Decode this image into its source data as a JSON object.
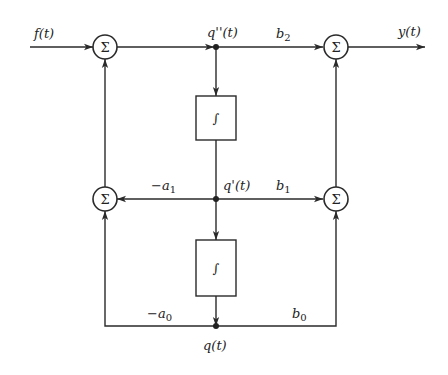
{
  "diagram": {
    "type": "block-diagram",
    "signals": {
      "input": "f(t)",
      "output": "y(t)",
      "q_dd": "q''(t)",
      "q_d": "q'(t)",
      "q": "q(t)"
    },
    "gains": {
      "b2": "b",
      "b2_sub": "2",
      "b1": "b",
      "b1_sub": "1",
      "b0": "b",
      "b0_sub": "0",
      "a1": "−a",
      "a1_sub": "1",
      "a0": "−a",
      "a0_sub": "0"
    },
    "summers": {
      "symbol": "Σ"
    },
    "integrators": {
      "symbol": "∫"
    },
    "nodes": [
      {
        "id": "sum-input",
        "label": "Σ"
      },
      {
        "id": "sum-output",
        "label": "Σ"
      },
      {
        "id": "sum-feedback",
        "label": "Σ"
      },
      {
        "id": "sum-feedforward",
        "label": "Σ"
      },
      {
        "id": "integrator-1",
        "label": "∫"
      },
      {
        "id": "integrator-2",
        "label": "∫"
      }
    ],
    "edges": [
      {
        "from": "f(t)",
        "to": "sum-input"
      },
      {
        "from": "sum-input",
        "to": "q''(t)"
      },
      {
        "from": "q''(t)",
        "to": "integrator-1"
      },
      {
        "from": "q''(t)",
        "to": "sum-output",
        "gain": "b2"
      },
      {
        "from": "sum-output",
        "to": "y(t)"
      },
      {
        "from": "integrator-1",
        "to": "q'(t)"
      },
      {
        "from": "q'(t)",
        "to": "sum-feedback",
        "gain": "-a1"
      },
      {
        "from": "q'(t)",
        "to": "sum-feedforward",
        "gain": "b1"
      },
      {
        "from": "q'(t)",
        "to": "integrator-2"
      },
      {
        "from": "integrator-2",
        "to": "q(t)"
      },
      {
        "from": "q(t)",
        "to": "sum-feedback",
        "gain": "-a0"
      },
      {
        "from": "q(t)",
        "to": "sum-feedforward",
        "gain": "b0"
      },
      {
        "from": "sum-feedback",
        "to": "sum-input"
      },
      {
        "from": "sum-feedforward",
        "to": "sum-output"
      }
    ]
  }
}
